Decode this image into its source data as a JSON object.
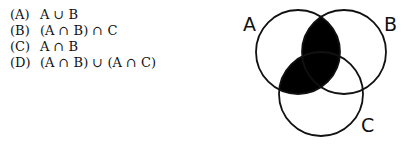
{
  "options": [
    {
      "label": "(A)",
      "expression": "A ∪ B"
    },
    {
      "label": "(B)",
      "expression": "(A ∩ B) ∩ C"
    },
    {
      "label": "(C)",
      "expression": "A ∩ B"
    },
    {
      "label": "(D)",
      "expression": "(A ∩ B) ∪ (A ∩ C)"
    }
  ],
  "venn": {
    "sets": [
      {
        "name": "A",
        "cx": 298,
        "cy": 52,
        "r": 42
      },
      {
        "name": "B",
        "cx": 344,
        "cy": 52,
        "r": 42
      },
      {
        "name": "C",
        "cx": 321,
        "cy": 94,
        "r": 42
      }
    ],
    "shaded_region": "(A ∩ B) ∪ (A ∩ C)",
    "shade_color": "#000000",
    "stroke_color": "#111111"
  }
}
